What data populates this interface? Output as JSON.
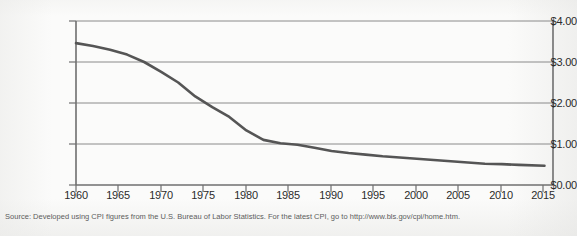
{
  "source_note": "Source: Developed using CPI figures from the U.S. Bureau of Labor Statistics. For the latest CPI, go to http://www.bls.gov/cpi/home.htm.",
  "colors": {
    "line": "#555555",
    "gridline": "#8a8a8a",
    "axis": "#6f6f6f",
    "text": "#2b2b2b",
    "source_text": "#5c5c5c",
    "background": "#fbfbfa"
  },
  "chart_data": {
    "type": "line",
    "title": "",
    "subtitle": "",
    "xlabel": "",
    "ylabel": "",
    "xlim": [
      1960,
      2016
    ],
    "ylim": [
      0.0,
      4.0
    ],
    "grid": true,
    "legend": "none",
    "y_tick_labels": [
      "$4.00",
      "$3.00",
      "$2.00",
      "$1.00",
      "$0.00"
    ],
    "y_ticks": [
      4.0,
      3.0,
      2.0,
      1.0,
      0.0
    ],
    "x_tick_labels": [
      "1960",
      "1965",
      "1970",
      "1975",
      "1980",
      "1985",
      "1990",
      "1995",
      "2000",
      "2005",
      "2010",
      "2015"
    ],
    "x_ticks": [
      1960,
      1965,
      1970,
      1975,
      1980,
      1985,
      1990,
      1995,
      2000,
      2005,
      2010,
      2015
    ],
    "series": [
      {
        "name": "Value of the dollar",
        "x": [
          1960,
          1962,
          1964,
          1966,
          1968,
          1970,
          1972,
          1974,
          1976,
          1978,
          1980,
          1982,
          1984,
          1986,
          1988,
          1990,
          1992,
          1994,
          1996,
          1998,
          2000,
          2002,
          2004,
          2006,
          2008,
          2010,
          2012,
          2015
        ],
        "values": [
          3.46,
          3.39,
          3.3,
          3.18,
          3.0,
          2.76,
          2.5,
          2.16,
          1.9,
          1.66,
          1.33,
          1.1,
          1.02,
          0.98,
          0.91,
          0.83,
          0.78,
          0.74,
          0.7,
          0.67,
          0.64,
          0.61,
          0.58,
          0.55,
          0.52,
          0.51,
          0.49,
          0.47
        ]
      }
    ]
  }
}
